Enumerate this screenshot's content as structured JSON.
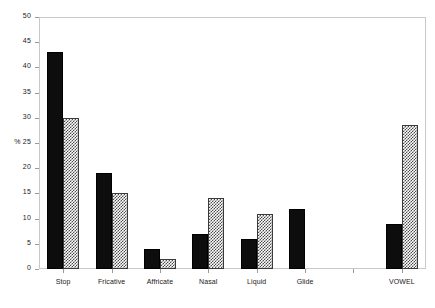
{
  "chart_data": {
    "type": "bar",
    "title": "",
    "xlabel": "",
    "ylabel": "%",
    "ylim": [
      0,
      50
    ],
    "ytick_step": 5,
    "yticks": [
      0,
      5,
      10,
      15,
      20,
      25,
      30,
      35,
      40,
      45,
      50
    ],
    "ytick_labels": [
      "0",
      "5",
      "10",
      "15",
      "20",
      "25",
      "30",
      "35",
      "40",
      "45",
      "50"
    ],
    "ylabel_attached_to_tick": "25",
    "grid": false,
    "legend": "none",
    "categories": [
      "Stop",
      "Fricative",
      "Affricate",
      "Nasal",
      "Liquid",
      "Glide",
      "",
      "VOWEL"
    ],
    "series": [
      {
        "name": "series-a",
        "style": "solid-black",
        "color": "#0d0d0d",
        "values": [
          43,
          19,
          4,
          7,
          6,
          12,
          null,
          9
        ]
      },
      {
        "name": "series-b",
        "style": "checkered-gray",
        "color": "#4a4a4a",
        "values": [
          30,
          15,
          2,
          14,
          11,
          null,
          null,
          28.5
        ]
      }
    ]
  },
  "axis": {
    "y_title": "%",
    "y_tick_labels": [
      "50",
      "45",
      "40",
      "35",
      "30",
      "% 25",
      "20",
      "15",
      "10",
      "5",
      "0"
    ],
    "x_tick_labels": [
      "Stop",
      "Fricative",
      "Affricate",
      "Nasal",
      "Liquid",
      "Glide",
      "",
      "VOWEL"
    ]
  }
}
